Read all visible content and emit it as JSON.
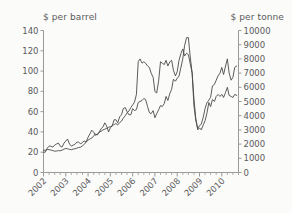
{
  "chart_data": {
    "type": "line",
    "title": "",
    "xlabel": "",
    "ylabel": "$ per barrel",
    "y2label": "$ per tonne",
    "grid": false,
    "legend": "none",
    "xlim": [
      2002.0,
      2010.75
    ],
    "ylim": [
      0,
      140
    ],
    "y2lim": [
      0,
      10000
    ],
    "ytick_labels": [
      "140",
      "120",
      "100",
      "80",
      "60",
      "40",
      "20",
      "0"
    ],
    "ytick_values": [
      140,
      120,
      100,
      80,
      60,
      40,
      20,
      0
    ],
    "y2tick_labels": [
      "10000",
      "9000",
      "8000",
      "7000",
      "6000",
      "5000",
      "4000",
      "3000",
      "2000",
      "1000",
      "0"
    ],
    "y2tick_values": [
      10000,
      9000,
      8000,
      7000,
      6000,
      5000,
      4000,
      3000,
      2000,
      1000,
      0
    ],
    "xtick_labels": [
      "2002",
      "2003",
      "2004",
      "2005",
      "2006",
      "2007",
      "2008",
      "2009",
      "2010"
    ],
    "xtick_values": [
      2002,
      2003,
      2004,
      2005,
      2006,
      2007,
      2008,
      2009,
      2010
    ],
    "x": [
      2002.0,
      2002.08,
      2002.17,
      2002.25,
      2002.33,
      2002.42,
      2002.5,
      2002.58,
      2002.67,
      2002.75,
      2002.83,
      2002.92,
      2003.0,
      2003.08,
      2003.17,
      2003.25,
      2003.33,
      2003.42,
      2003.5,
      2003.58,
      2003.67,
      2003.75,
      2003.83,
      2003.92,
      2004.0,
      2004.08,
      2004.17,
      2004.25,
      2004.33,
      2004.42,
      2004.5,
      2004.58,
      2004.67,
      2004.75,
      2004.83,
      2004.92,
      2005.0,
      2005.08,
      2005.17,
      2005.25,
      2005.33,
      2005.42,
      2005.5,
      2005.58,
      2005.67,
      2005.75,
      2005.83,
      2005.92,
      2006.0,
      2006.08,
      2006.17,
      2006.25,
      2006.33,
      2006.42,
      2006.5,
      2006.58,
      2006.67,
      2006.75,
      2006.83,
      2006.92,
      2007.0,
      2007.08,
      2007.17,
      2007.25,
      2007.33,
      2007.42,
      2007.5,
      2007.58,
      2007.67,
      2007.75,
      2007.83,
      2007.92,
      2008.0,
      2008.08,
      2008.17,
      2008.25,
      2008.33,
      2008.42,
      2008.5,
      2008.58,
      2008.67,
      2008.75,
      2008.83,
      2008.92,
      2009.0,
      2009.08,
      2009.17,
      2009.25,
      2009.33,
      2009.42,
      2009.5,
      2009.58,
      2009.67,
      2009.75,
      2009.83,
      2009.92,
      2010.0,
      2010.08,
      2010.17,
      2010.25,
      2010.33,
      2010.42,
      2010.5,
      2010.58,
      2010.67
    ],
    "series": [
      {
        "name": "Crude oil ($ per barrel)",
        "axis": "left",
        "unit": "$ per barrel",
        "values": [
          20,
          20,
          24,
          26,
          26,
          25,
          27,
          28,
          29,
          26,
          25,
          29,
          31,
          33,
          28,
          26,
          27,
          28,
          30,
          30,
          28,
          30,
          31,
          30,
          32,
          33,
          34,
          36,
          38,
          37,
          40,
          43,
          45,
          49,
          46,
          40,
          44,
          46,
          52,
          52,
          49,
          55,
          57,
          63,
          64,
          60,
          57,
          57,
          63,
          61,
          62,
          69,
          70,
          71,
          73,
          72,
          65,
          59,
          58,
          61,
          54,
          58,
          62,
          66,
          65,
          68,
          75,
          71,
          78,
          82,
          92,
          90,
          93,
          95,
          104,
          112,
          125,
          133,
          133,
          115,
          98,
          73,
          54,
          42,
          44,
          42,
          47,
          51,
          58,
          69,
          65,
          72,
          70,
          75,
          77,
          75,
          77,
          74,
          79,
          84,
          76,
          75,
          74,
          77,
          76
        ]
      },
      {
        "name": "Copper ($ per tonne)",
        "axis": "right",
        "unit": "$ per tonne",
        "values": [
          1560,
          1570,
          1620,
          1610,
          1580,
          1540,
          1500,
          1510,
          1540,
          1530,
          1570,
          1650,
          1690,
          1670,
          1630,
          1600,
          1650,
          1670,
          1720,
          1760,
          1790,
          1880,
          1980,
          2180,
          2480,
          2720,
          2980,
          2840,
          2620,
          2700,
          2830,
          2900,
          3000,
          3050,
          3100,
          3180,
          3230,
          3280,
          3380,
          3450,
          3350,
          3520,
          3620,
          3820,
          4000,
          4200,
          4330,
          4580,
          4760,
          4940,
          5500,
          7800,
          8000,
          7700,
          7800,
          7700,
          7500,
          7400,
          7000,
          6700,
          5700,
          5600,
          6500,
          7800,
          7700,
          7600,
          7900,
          7500,
          7800,
          7900,
          7200,
          6800,
          7100,
          7900,
          8400,
          8700,
          8200,
          8400,
          8300,
          7700,
          7000,
          4700,
          3700,
          3100,
          3300,
          3400,
          3900,
          4500,
          4900,
          5100,
          5300,
          6100,
          6200,
          6500,
          6800,
          7000,
          7400,
          6900,
          7500,
          8000,
          7000,
          6500,
          6700,
          7400,
          7500
        ]
      }
    ]
  },
  "axes": {
    "left_title": "$ per barrel",
    "right_title": "$ per tonne"
  },
  "colors": {
    "line": "#4a4a4a",
    "axis": "#9a9a9a",
    "text": "#5a5a5a",
    "background": "#fbfbfa",
    "page": "#f2f2f0"
  }
}
